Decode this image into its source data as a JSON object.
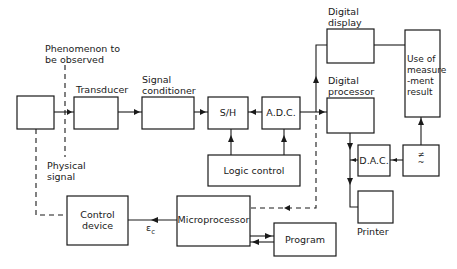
{
  "diagram": {
    "annotations": {
      "phenomenon": [
        "Phenomenon to",
        "be observed"
      ],
      "physical_signal": [
        "Physical",
        "signal"
      ],
      "control_signal": "ε",
      "control_signal_sub": "c"
    },
    "blocks": {
      "source": "",
      "transducer": "Transducer",
      "signal_conditioner": [
        "Signal",
        "conditioner"
      ],
      "sample_hold": "S/H",
      "adc": "A.D.C.",
      "digital_display": [
        "Digital",
        "display"
      ],
      "digital_processor": [
        "Digital",
        "processor"
      ],
      "use_of_result": [
        "Use of",
        "measure",
        "-ment",
        "result"
      ],
      "dac": "D.A.C.",
      "ac_dc_converter": [
        "≠",
        "~"
      ],
      "printer": "Printer",
      "logic_control": "Logic control",
      "microprocessor": "Microprocessor",
      "program": "Program",
      "control_device": [
        "Control",
        "device"
      ]
    },
    "connections": [
      {
        "from": "source",
        "to": "transducer",
        "style": "solid"
      },
      {
        "from": "transducer",
        "to": "signal_conditioner",
        "style": "solid"
      },
      {
        "from": "signal_conditioner",
        "to": "sample_hold",
        "style": "solid"
      },
      {
        "from": "adc",
        "to": "sample_hold",
        "style": "solid"
      },
      {
        "from": "adc",
        "to": "digital_processor",
        "style": "solid"
      },
      {
        "from": "adc",
        "to": "digital_display",
        "style": "solid"
      },
      {
        "from": "digital_display",
        "to": "use_of_result",
        "style": "solid"
      },
      {
        "from": "logic_control",
        "to": "sample_hold",
        "style": "solid"
      },
      {
        "from": "logic_control",
        "to": "adc",
        "style": "solid"
      },
      {
        "from": "digital_processor",
        "to": "printer",
        "style": "solid"
      },
      {
        "from": "dac",
        "to": "digital_processor_line",
        "style": "solid"
      },
      {
        "from": "ac_dc_converter",
        "to": "dac",
        "style": "solid"
      },
      {
        "from": "ac_dc_converter",
        "to": "use_of_result",
        "style": "solid"
      },
      {
        "from": "adc_output",
        "to": "microprocessor",
        "style": "dashed"
      },
      {
        "from": "microprocessor",
        "to": "control_device",
        "style": "solid"
      },
      {
        "from": "microprocessor",
        "to": "program",
        "style": "solid"
      },
      {
        "from": "program",
        "to": "microprocessor",
        "style": "solid"
      },
      {
        "from": "control_device",
        "to": "source",
        "style": "dashed"
      }
    ]
  }
}
